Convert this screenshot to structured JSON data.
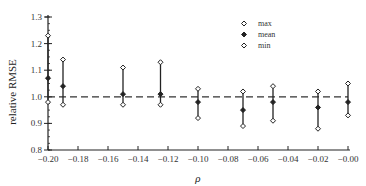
{
  "chart_data": {
    "type": "scatter",
    "subtype": "error-range",
    "title": "",
    "xlabel": "ρ",
    "ylabel": "relative RMSE",
    "xlim": [
      -0.2,
      0.0
    ],
    "ylim": [
      0.8,
      1.3
    ],
    "x_ticks": [
      "-0.20",
      "-0.18",
      "-0.16",
      "-0.14",
      "-0.12",
      "-0.10",
      "-0.08",
      "-0.06",
      "-0.04",
      "-0.02",
      "-0.00"
    ],
    "y_ticks": [
      "0.8",
      "0.9",
      "1.0",
      "1.1",
      "1.2",
      "1.3"
    ],
    "grid": false,
    "reference_line": {
      "y": 1.0,
      "style": "dashed"
    },
    "legend": {
      "position": "upper right",
      "entries": [
        "max",
        "mean",
        "min"
      ]
    },
    "x": [
      -0.2,
      -0.19,
      -0.15,
      -0.125,
      -0.1,
      -0.07,
      -0.05,
      -0.02,
      0.0
    ],
    "series": [
      {
        "name": "max",
        "marker": "open-diamond",
        "values": [
          1.23,
          1.14,
          1.11,
          1.13,
          1.03,
          1.02,
          1.04,
          1.02,
          1.05
        ]
      },
      {
        "name": "mean",
        "marker": "filled-diamond",
        "values": [
          1.07,
          1.04,
          1.01,
          1.01,
          0.98,
          0.95,
          0.98,
          0.96,
          0.98
        ]
      },
      {
        "name": "min",
        "marker": "open-diamond",
        "values": [
          0.98,
          0.97,
          0.97,
          0.97,
          0.92,
          0.89,
          0.91,
          0.88,
          0.93
        ]
      }
    ]
  },
  "labels": {
    "ylabel": "relative RMSE",
    "xlabel": "ρ",
    "legend_max": "max",
    "legend_mean": "mean",
    "legend_min": "min"
  }
}
